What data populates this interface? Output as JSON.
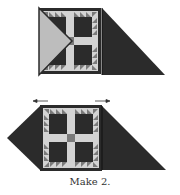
{
  "caption": "Make 2.",
  "colors": {
    "dark": "#2b2b2b",
    "medium": "#7a7a7a",
    "light": "#d3d3d3",
    "lighter": "#bdbdbd",
    "background": "#ffffff"
  },
  "units": [
    {
      "name": "top-unit",
      "description": "quilt block with light setting triangle left and dark triangle right"
    },
    {
      "name": "bottom-unit",
      "description": "quilt block with dark triangles left and right, pressing arrows above"
    }
  ],
  "arrows": [
    {
      "direction": "left"
    },
    {
      "direction": "right"
    }
  ]
}
